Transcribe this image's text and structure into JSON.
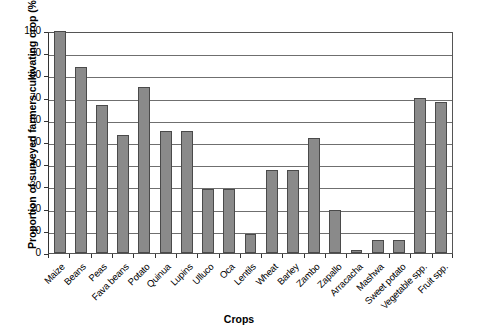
{
  "chart_data": {
    "type": "bar",
    "title": "",
    "xlabel": "Crops",
    "ylabel": "Proportion of surveyed farmers cultivating crop (%)",
    "ylim": [
      0,
      100
    ],
    "yticks": [
      0,
      10,
      20,
      30,
      40,
      50,
      60,
      70,
      80,
      90,
      100
    ],
    "grid": true,
    "legend": "none",
    "bar_color": "#8a8a8a",
    "bar_border_color": "#4a4a4a",
    "categories": [
      "Maize",
      "Beans",
      "Peas",
      "Fava beans",
      "Potato",
      "Quinua",
      "Lupins",
      "Ulluco",
      "Oca",
      "Lentils",
      "Wheat",
      "Barley",
      "Zambo",
      "Zapallo",
      "Arracacha",
      "Mashwa",
      "Sweet potato",
      "Vegetable spp.",
      "Fruit spp."
    ],
    "values": [
      100,
      84,
      66.5,
      53,
      75,
      55,
      55,
      29,
      29,
      8.5,
      37.5,
      37.5,
      52,
      19.5,
      1.5,
      6,
      6,
      70,
      68
    ]
  }
}
